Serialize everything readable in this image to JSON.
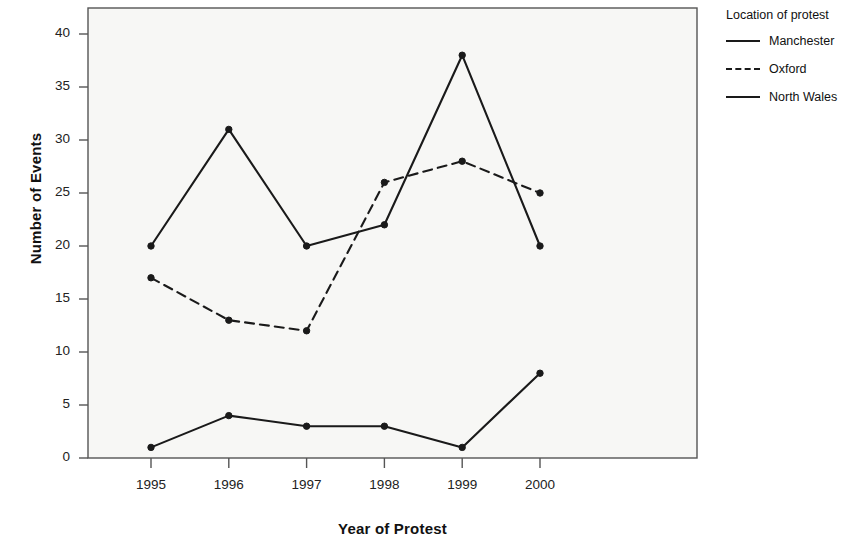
{
  "chart_data": {
    "type": "line",
    "title": "",
    "xlabel": "Year of Protest",
    "ylabel": "Number of Events",
    "categories": [
      "1995",
      "1996",
      "1997",
      "1998",
      "1999",
      "2000"
    ],
    "x": [
      1995,
      1996,
      1997,
      1998,
      1999,
      2000
    ],
    "series": [
      {
        "name": "Manchester",
        "style": "solid",
        "color": "#1a1a1a",
        "values": [
          20,
          31,
          20,
          22,
          38,
          20
        ]
      },
      {
        "name": "Oxford",
        "style": "dashed",
        "color": "#1a1a1a",
        "values": [
          17,
          13,
          12,
          26,
          28,
          25
        ]
      },
      {
        "name": "North Wales",
        "style": "solid",
        "color": "#1a1a1a",
        "values": [
          1,
          4,
          3,
          3,
          1,
          8
        ]
      }
    ],
    "ylim": [
      0,
      42
    ],
    "yticks": [
      0,
      5,
      10,
      15,
      20,
      25,
      30,
      35,
      40
    ],
    "ytick_labels": [
      "0",
      "5",
      "10",
      "15",
      "20",
      "25",
      "30",
      "35",
      "40"
    ],
    "xtick_labels": [
      "1995",
      "1996",
      "1997",
      "1998",
      "1999",
      "2000"
    ],
    "grid": false,
    "legend_position": "right",
    "legend_title": "Location of protest",
    "marker": "circle",
    "plot_background": "#f7f7f5",
    "frame_color": "#555555"
  },
  "legend": {
    "title": "Location of protest",
    "entries": [
      {
        "label": "Manchester",
        "style": "solid"
      },
      {
        "label": "Oxford",
        "style": "dashed"
      },
      {
        "label": "North Wales",
        "style": "solid"
      }
    ]
  },
  "axes": {
    "y_title": "Number of Events",
    "x_title": "Year of Protest"
  }
}
